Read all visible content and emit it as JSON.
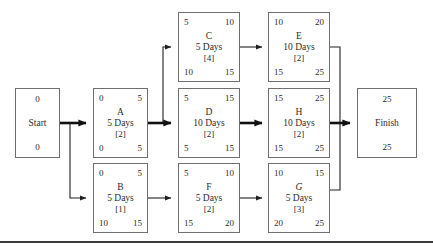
{
  "diagram": {
    "colors": {
      "box_border": "#6f6f6f",
      "edge": "#1f1f1f",
      "critical_edge": "#111111",
      "text": "#2b2b2b",
      "background": "#ffffff"
    },
    "start": {
      "label": "Start",
      "top_value": "0",
      "bottom_value": "0"
    },
    "finish": {
      "label": "Finish",
      "top_value": "25",
      "bottom_value": "25"
    },
    "activities": [
      {
        "id": "A",
        "name": "A",
        "early_start": "0",
        "early_finish": "5",
        "duration": "5 Days",
        "resources": "[2]",
        "late_start": "0",
        "late_finish": "5",
        "italic": false
      },
      {
        "id": "B",
        "name": "B",
        "early_start": "0",
        "early_finish": "5",
        "duration": "5 Days",
        "resources": "[1]",
        "late_start": "10",
        "late_finish": "15",
        "italic": false
      },
      {
        "id": "C",
        "name": "C",
        "early_start": "5",
        "early_finish": "10",
        "duration": "5 Days",
        "resources": "[4]",
        "late_start": "10",
        "late_finish": "15",
        "italic": false
      },
      {
        "id": "D",
        "name": "D",
        "early_start": "5",
        "early_finish": "15",
        "duration": "10 Days",
        "resources": "[2]",
        "late_start": "5",
        "late_finish": "15",
        "italic": false
      },
      {
        "id": "E",
        "name": "E",
        "early_start": "10",
        "early_finish": "20",
        "duration": "10 Days",
        "resources": "[2]",
        "late_start": "15",
        "late_finish": "25",
        "italic": false
      },
      {
        "id": "F",
        "name": "F",
        "early_start": "5",
        "early_finish": "10",
        "duration": "5 Days",
        "resources": "[2]",
        "late_start": "15",
        "late_finish": "20",
        "italic": false
      },
      {
        "id": "G",
        "name": "G",
        "early_start": "10",
        "early_finish": "15",
        "duration": "5 Days",
        "resources": "[3]",
        "late_start": "20",
        "late_finish": "25",
        "italic": true
      },
      {
        "id": "H",
        "name": "H",
        "early_start": "15",
        "early_finish": "25",
        "duration": "10 Days",
        "resources": "[2]",
        "late_start": "15",
        "late_finish": "25",
        "italic": false
      }
    ],
    "edges": [
      {
        "from": "Start",
        "to": "A",
        "critical": true
      },
      {
        "from": "Start",
        "to": "B",
        "critical": false
      },
      {
        "from": "A",
        "to": "C",
        "critical": false
      },
      {
        "from": "A",
        "to": "D",
        "critical": true
      },
      {
        "from": "B",
        "to": "F",
        "critical": false
      },
      {
        "from": "C",
        "to": "E",
        "critical": false
      },
      {
        "from": "D",
        "to": "H",
        "critical": true
      },
      {
        "from": "F",
        "to": "G",
        "critical": false
      },
      {
        "from": "E",
        "to": "Finish",
        "critical": false
      },
      {
        "from": "H",
        "to": "Finish",
        "critical": true
      },
      {
        "from": "G",
        "to": "Finish",
        "critical": false
      }
    ]
  }
}
